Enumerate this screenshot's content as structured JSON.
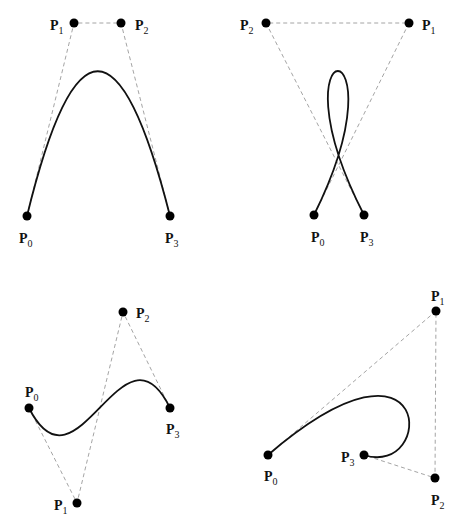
{
  "diagram": {
    "line_color": "#111111",
    "control_polygon_color": "#9a9a9a",
    "panels": [
      {
        "id": "arch",
        "points": {
          "P0": [
            27,
            216
          ],
          "P1": [
            74,
            23
          ],
          "P2": [
            121,
            23
          ],
          "P3": [
            170,
            216
          ]
        },
        "labels": [
          {
            "name": "P",
            "sub": "0",
            "x": 19,
            "y": 243
          },
          {
            "name": "P",
            "sub": "1",
            "x": 50,
            "y": 30
          },
          {
            "name": "P",
            "sub": "2",
            "x": 135,
            "y": 30
          },
          {
            "name": "P",
            "sub": "3",
            "x": 165,
            "y": 243
          }
        ]
      },
      {
        "id": "loop",
        "points": {
          "P0": [
            314,
            215
          ],
          "P1": [
            409,
            23
          ],
          "P2": [
            266,
            23
          ],
          "P3": [
            364,
            215
          ]
        },
        "labels": [
          {
            "name": "P",
            "sub": "0",
            "x": 311,
            "y": 242
          },
          {
            "name": "P",
            "sub": "1",
            "x": 422,
            "y": 30
          },
          {
            "name": "P",
            "sub": "2",
            "x": 240,
            "y": 30
          },
          {
            "name": "P",
            "sub": "3",
            "x": 360,
            "y": 242
          }
        ]
      },
      {
        "id": "s-curve",
        "points": {
          "P0": [
            29,
            408
          ],
          "P1": [
            77,
            503
          ],
          "P2": [
            123,
            312
          ],
          "P3": [
            170,
            408
          ]
        },
        "labels": [
          {
            "name": "P",
            "sub": "0",
            "x": 25,
            "y": 397
          },
          {
            "name": "P",
            "sub": "1",
            "x": 54,
            "y": 510
          },
          {
            "name": "P",
            "sub": "2",
            "x": 136,
            "y": 318
          },
          {
            "name": "P",
            "sub": "3",
            "x": 166,
            "y": 434
          }
        ]
      },
      {
        "id": "hook",
        "points": {
          "P0": [
            268,
            455
          ],
          "P1": [
            436,
            311
          ],
          "P2": [
            435,
            478
          ],
          "P3": [
            364,
            455
          ]
        },
        "labels": [
          {
            "name": "P",
            "sub": "0",
            "x": 264,
            "y": 481
          },
          {
            "name": "P",
            "sub": "1",
            "x": 431,
            "y": 301
          },
          {
            "name": "P",
            "sub": "2",
            "x": 431,
            "y": 505
          },
          {
            "name": "P",
            "sub": "3",
            "x": 341,
            "y": 462
          }
        ]
      }
    ]
  }
}
